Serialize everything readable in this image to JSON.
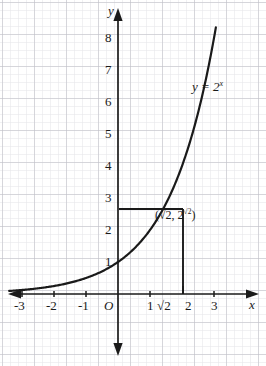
{
  "figure": {
    "kind": "cartesian-graph",
    "background": "#ffffff",
    "ink_color": "#1a1a1a",
    "grid_minor_color": "#e2e2e6",
    "grid_major_color": "#b9b9c0"
  },
  "axes": {
    "x_label": "x",
    "y_label": "y",
    "origin_label": "O",
    "x_ticks": [
      "-3",
      "-2",
      "-1",
      "1",
      "2",
      "3"
    ],
    "x_special_tick": "√2",
    "y_ticks": [
      "1",
      "2",
      "3",
      "4",
      "5",
      "6",
      "7",
      "8"
    ]
  },
  "curve": {
    "function_label_prefix": "y = 2",
    "function_label_exponent": "x"
  },
  "marked_point": {
    "open_paren": "(",
    "x_value": "√2",
    "comma": ", ",
    "y_base": "2",
    "y_exponent": "√2",
    "close_paren": ")"
  },
  "chart_data": {
    "type": "line",
    "title": "",
    "xlabel": "x",
    "ylabel": "y",
    "xlim": [
      -3.6,
      3.7
    ],
    "ylim": [
      -1.8,
      8.6
    ],
    "grid": true,
    "grid_minor_step": 0.25,
    "grid_major_step": 1,
    "legend": "none",
    "series": [
      {
        "name": "y = 2^x",
        "equation": "y = 2^x",
        "x": [
          -3.4,
          -3,
          -2.5,
          -2,
          -1.5,
          -1,
          -0.5,
          0,
          0.5,
          1,
          1.4142,
          1.5,
          2,
          2.5,
          3,
          3.55
        ],
        "y": [
          0.0948,
          0.125,
          0.1768,
          0.25,
          0.3536,
          0.5,
          0.7071,
          1,
          1.4142,
          2,
          2.6651,
          2.8284,
          4,
          5.6569,
          8,
          11.7
        ]
      }
    ],
    "annotations": [
      {
        "text": "y = 2^x",
        "x": 2.35,
        "y": 6.25,
        "kind": "curve-label"
      },
      {
        "text": "(√2, 2^√2)",
        "x": 1.72,
        "y": 2.36,
        "kind": "point-label"
      }
    ],
    "markers": [
      {
        "x": 1.4142,
        "y": 2.6651,
        "guide_horizontal": true,
        "guide_vertical": true,
        "label": "(√2, 2^√2)"
      }
    ]
  }
}
